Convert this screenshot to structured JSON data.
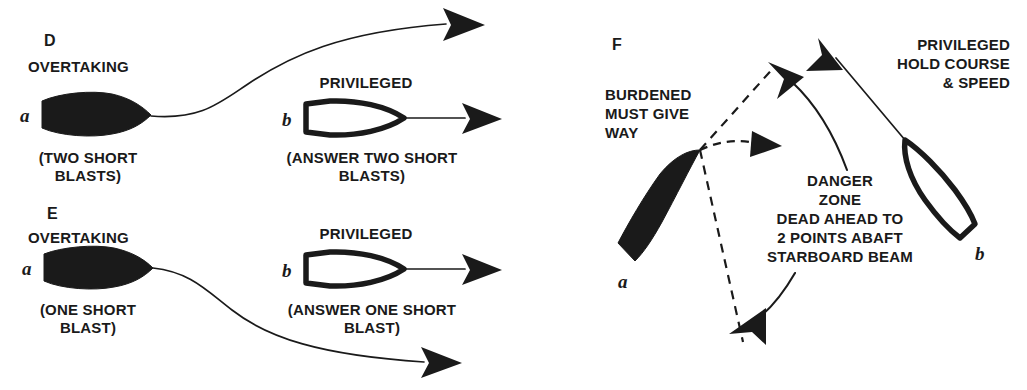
{
  "figure": {
    "background_color": "#ffffff",
    "ink_color": "#1a1a1a",
    "width": 1027,
    "height": 390
  },
  "panels": [
    {
      "id": "D",
      "panel_label": "D",
      "situation_label": "OVERTAKING",
      "vessel_a_label": "a",
      "vessel_a_caption_line1": "(TWO SHORT",
      "vessel_a_caption_line2": "BLASTS)",
      "status_label": "PRIVILEGED",
      "vessel_b_label": "b",
      "vessel_b_caption_line1": "(ANSWER TWO SHORT",
      "vessel_b_caption_line2": "BLASTS)"
    },
    {
      "id": "E",
      "panel_label": "E",
      "situation_label": "OVERTAKING",
      "vessel_a_label": "a",
      "vessel_a_caption_line1": "(ONE SHORT",
      "vessel_a_caption_line2": "BLAST)",
      "status_label": "PRIVILEGED",
      "vessel_b_label": "b",
      "vessel_b_caption_line1": "(ANSWER ONE SHORT",
      "vessel_b_caption_line2": "BLAST)"
    },
    {
      "id": "F",
      "panel_label": "F",
      "burdened_line1": "BURDENED",
      "burdened_line2": "MUST GIVE",
      "burdened_line3": "WAY",
      "privileged_line1": "PRIVILEGED",
      "privileged_line2": "HOLD COURSE",
      "privileged_line3": "& SPEED",
      "danger_line1": "DANGER",
      "danger_line2": "ZONE",
      "danger_line3": "DEAD AHEAD TO",
      "danger_line4": "2 POINTS ABAFT",
      "danger_line5": "STARBOARD BEAM",
      "vessel_a_label": "a",
      "vessel_b_label": "b"
    }
  ]
}
